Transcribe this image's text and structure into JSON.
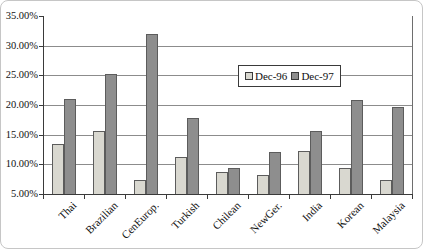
{
  "chart_data": {
    "type": "bar",
    "title": "",
    "xlabel": "",
    "ylabel": "",
    "categories": [
      "Thai",
      "Brazilian",
      "CenEurop.",
      "Turkish",
      "Chilean",
      "NewGer.",
      "India",
      "Korean",
      "Malaysia"
    ],
    "series": [
      {
        "name": "Dec-96",
        "color": "#d9d8d0",
        "values": [
          13.5,
          15.7,
          7.3,
          11.2,
          8.7,
          8.2,
          12.2,
          9.3,
          7.3
        ]
      },
      {
        "name": "Dec-97",
        "color": "#8e8e8e",
        "values": [
          21.0,
          25.2,
          32.0,
          17.8,
          9.4,
          12.0,
          15.6,
          20.9,
          19.6
        ]
      }
    ],
    "ylim": [
      5,
      35
    ],
    "ytick_step": 5,
    "ytick_labels": [
      "5.00%",
      "10.00%",
      "15.00%",
      "20.00%",
      "25.00%",
      "30.00%",
      "35.00%"
    ],
    "grid": true,
    "legend_position": "inside-top-center"
  },
  "colors": {
    "gridline": "#8c8c8c",
    "axis": "#3a3a3a",
    "bar_border": "#5c5c5c",
    "text": "#111111",
    "legend_border": "#3a3a3a",
    "legend_background": "#ffffff",
    "figure_border": "#c6c6c6",
    "background": "#ffffff"
  }
}
